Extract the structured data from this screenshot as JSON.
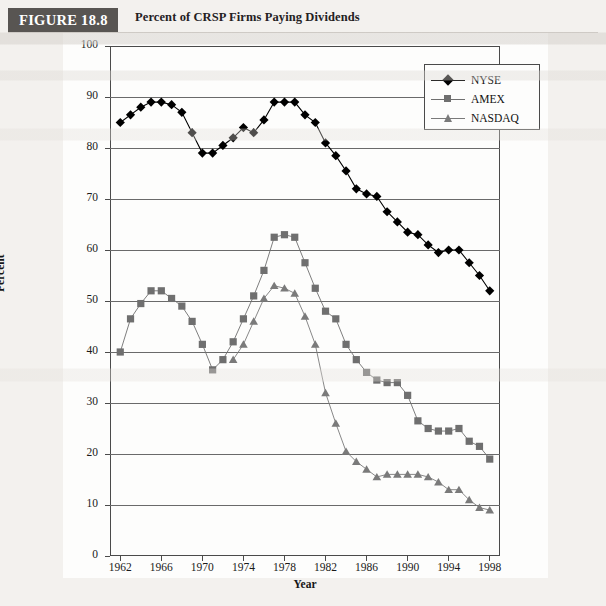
{
  "header": {
    "badge": "FIGURE 18.8",
    "caption": "Percent of CRSP Firms Paying Dividends"
  },
  "legend": {
    "position": "top-right",
    "entries": [
      {
        "label": "NYSE",
        "marker": "diamond",
        "color": "#000000"
      },
      {
        "label": "AMEX",
        "marker": "square",
        "color": "#6f6f6f"
      },
      {
        "label": "NASDAQ",
        "marker": "triangle",
        "color": "#7a7a7a"
      }
    ]
  },
  "chart_data": {
    "type": "line",
    "title": "Percent of CRSP Firms Paying Dividends",
    "xlabel": "Year",
    "ylabel": "Percent",
    "xlim": [
      1961,
      1999
    ],
    "ylim": [
      0,
      100
    ],
    "xticks": [
      1962,
      1966,
      1970,
      1974,
      1978,
      1982,
      1986,
      1990,
      1994,
      1998
    ],
    "yticks": [
      0,
      10,
      20,
      30,
      40,
      50,
      60,
      70,
      80,
      90,
      100
    ],
    "grid": "horizontal",
    "x": [
      1962,
      1963,
      1964,
      1965,
      1966,
      1967,
      1968,
      1969,
      1970,
      1971,
      1972,
      1973,
      1974,
      1975,
      1976,
      1977,
      1978,
      1979,
      1980,
      1981,
      1982,
      1983,
      1984,
      1985,
      1986,
      1987,
      1988,
      1989,
      1990,
      1991,
      1992,
      1993,
      1994,
      1995,
      1996,
      1997,
      1998
    ],
    "series": [
      {
        "name": "NYSE",
        "marker": "diamond",
        "color": "#000000",
        "values": [
          85,
          86.5,
          88,
          89,
          89,
          88.5,
          87,
          83,
          79,
          79,
          80.5,
          82,
          84,
          83,
          85.5,
          89,
          89,
          89,
          86.5,
          85,
          81,
          78.5,
          75.5,
          72,
          71,
          70.5,
          67.5,
          65.5,
          63.5,
          63,
          61,
          59.5,
          60,
          60,
          57.5,
          55,
          52
        ]
      },
      {
        "name": "AMEX",
        "marker": "square",
        "color": "#6f6f6f",
        "values": [
          40,
          46.5,
          49.5,
          52,
          52,
          50.5,
          49,
          46,
          41.5,
          36.5,
          38.5,
          42,
          46.5,
          51,
          56,
          62.5,
          63,
          62.5,
          57.5,
          52.5,
          48,
          46.5,
          41.5,
          38.5,
          36,
          34.5,
          34,
          34,
          31.5,
          26.5,
          25,
          24.5,
          24.5,
          25,
          22.5,
          21.5,
          19
        ]
      },
      {
        "name": "NASDAQ",
        "marker": "triangle",
        "color": "#7a7a7a",
        "values": [
          null,
          null,
          null,
          null,
          null,
          null,
          null,
          null,
          null,
          null,
          null,
          38.5,
          41.5,
          46,
          50.5,
          53,
          52.5,
          51.5,
          47,
          41.5,
          32,
          26,
          20.5,
          18.5,
          17,
          15.5,
          16,
          16,
          16,
          16,
          15.5,
          14.5,
          13,
          13,
          11,
          9.5,
          9
        ]
      }
    ],
    "annotations": []
  }
}
